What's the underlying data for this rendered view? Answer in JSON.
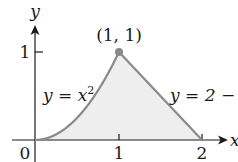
{
  "diagram": {
    "type": "region-between-curves",
    "axes": {
      "x_label": "x",
      "y_label": "y",
      "origin_label": "0",
      "x_ticks": [
        "1",
        "2"
      ],
      "y_ticks": [
        "1"
      ]
    },
    "curves": [
      {
        "label": "y = x²",
        "label_parts": {
          "lhs": "y",
          "eq": " = ",
          "base": "x",
          "sup": "2"
        },
        "domain": [
          0,
          1
        ]
      },
      {
        "label": "y = 2 − x",
        "label_parts": {
          "text": "y = 2 − x"
        },
        "domain": [
          1,
          2
        ]
      }
    ],
    "point": {
      "label": "(1, 1)",
      "x": 1,
      "y": 1
    },
    "colors": {
      "curve": "#8a8a8a",
      "fill": "#eeeeee",
      "axis": "#1a1a1a",
      "point": "#8a8a8a"
    }
  }
}
